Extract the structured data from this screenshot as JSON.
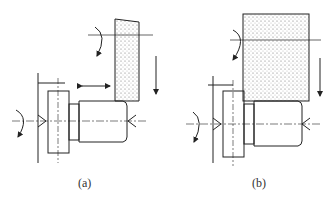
{
  "figure": {
    "panels": [
      {
        "id": "a",
        "label": "(a)",
        "description": "Grinding wheel with tapered face at shoulder; wheel rotates, feeds down; axial traverse arrow"
      },
      {
        "id": "b",
        "label": "(b)",
        "description": "Wide grinding wheel plunge grinding shoulder and cylinder; wheel feeds down"
      }
    ]
  }
}
